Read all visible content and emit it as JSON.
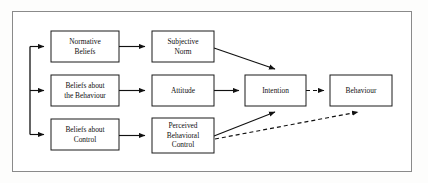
{
  "figure": {
    "frame": {
      "x": 12,
      "y": 11,
      "width": 400,
      "height": 161,
      "border_color": "#8a8a8a"
    },
    "background_color": "#ffffff",
    "line_color": "#111111"
  },
  "nodes": [
    {
      "id": "normative-beliefs",
      "lines": [
        "Normative",
        "Beliefs"
      ],
      "x": 51,
      "y": 31,
      "width": 68,
      "height": 31
    },
    {
      "id": "beliefs-about-behaviour",
      "lines": [
        "Beliefs about",
        "the Behaviour"
      ],
      "x": 51,
      "y": 75,
      "width": 68,
      "height": 31
    },
    {
      "id": "beliefs-about-control",
      "lines": [
        "Beliefs about",
        "Control"
      ],
      "x": 51,
      "y": 119,
      "width": 68,
      "height": 31
    },
    {
      "id": "subjective-norm",
      "lines": [
        "Subjective",
        "Norm"
      ],
      "x": 152,
      "y": 31,
      "width": 62,
      "height": 31
    },
    {
      "id": "attitude",
      "lines": [
        "Attitude"
      ],
      "x": 152,
      "y": 75,
      "width": 62,
      "height": 31
    },
    {
      "id": "perceived-behavioral-control",
      "lines": [
        "Perceived",
        "Behavioral",
        "Control"
      ],
      "x": 152,
      "y": 118,
      "width": 62,
      "height": 35
    },
    {
      "id": "intention",
      "lines": [
        "Intention"
      ],
      "x": 245,
      "y": 75,
      "width": 61,
      "height": 31
    },
    {
      "id": "behaviour",
      "lines": [
        "Behaviour"
      ],
      "x": 330,
      "y": 75,
      "width": 62,
      "height": 31
    }
  ],
  "edges": [
    {
      "id": "trunk-to-normative-beliefs",
      "style": "solid",
      "from": "trunk",
      "to": "normative-beliefs"
    },
    {
      "id": "trunk-to-beliefs-about-behaviour",
      "style": "solid",
      "from": "trunk",
      "to": "beliefs-about-behaviour"
    },
    {
      "id": "trunk-to-beliefs-about-control",
      "style": "solid",
      "from": "trunk",
      "to": "beliefs-about-control"
    },
    {
      "id": "normative-beliefs-to-subjective-norm",
      "style": "solid",
      "from": "normative-beliefs",
      "to": "subjective-norm"
    },
    {
      "id": "beliefs-about-behaviour-to-attitude",
      "style": "solid",
      "from": "beliefs-about-behaviour",
      "to": "attitude"
    },
    {
      "id": "beliefs-about-control-to-perceived-behavioral-control",
      "style": "solid",
      "from": "beliefs-about-control",
      "to": "perceived-behavioral-control"
    },
    {
      "id": "subjective-norm-to-intention",
      "style": "solid",
      "from": "subjective-norm",
      "to": "intention"
    },
    {
      "id": "attitude-to-intention",
      "style": "solid",
      "from": "attitude",
      "to": "intention"
    },
    {
      "id": "perceived-behavioral-control-to-intention",
      "style": "solid",
      "from": "perceived-behavioral-control",
      "to": "intention"
    },
    {
      "id": "intention-to-behaviour",
      "style": "dashed",
      "from": "intention",
      "to": "behaviour"
    },
    {
      "id": "perceived-behavioral-control-to-behaviour",
      "style": "dashed",
      "from": "perceived-behavioral-control",
      "to": "behaviour"
    }
  ]
}
